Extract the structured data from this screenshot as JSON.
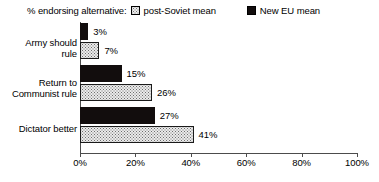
{
  "chart_data": {
    "type": "bar",
    "orientation": "horizontal",
    "title": "",
    "legend_title": "% endorsing alternative:",
    "legend_position": "top",
    "categories": [
      "Army should rule",
      "Return to Communist rule",
      "Dictator better"
    ],
    "series": [
      {
        "name": "New EU mean",
        "values": [
          3,
          15,
          27
        ],
        "value_labels": [
          "3%",
          "15%",
          "27%"
        ],
        "swatch": "solid",
        "color": "#120d0d"
      },
      {
        "name": "post-Soviet mean",
        "values": [
          7,
          26,
          41
        ],
        "value_labels": [
          "7%",
          "26%",
          "41%"
        ],
        "swatch": "dotted",
        "color": "#ebebeb"
      }
    ],
    "xlabel": "",
    "ylabel": "",
    "xlim": [
      0,
      100
    ],
    "xticks": [
      0,
      20,
      40,
      60,
      80,
      100
    ],
    "xtick_labels": [
      "0%",
      "20%",
      "40%",
      "60%",
      "80%",
      "100%"
    ],
    "grid": false,
    "axis_color": "#4c4c4c"
  },
  "legend": {
    "title": "% endorsing alternative:",
    "entries": [
      {
        "label": "post-Soviet mean"
      },
      {
        "label": "New EU mean"
      }
    ]
  },
  "category_labels": {
    "army_line1": "Army should",
    "army_line2": "rule",
    "communist_line1": "Return to",
    "communist_line2": "Communist rule",
    "dictator_line1": "Dictator better"
  }
}
